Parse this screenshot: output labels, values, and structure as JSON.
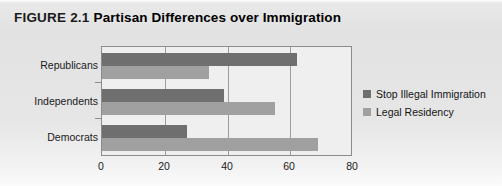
{
  "figure": {
    "label": "FIGURE 2.1",
    "title": "Partisan Differences over Immigration"
  },
  "legend": {
    "position": "right",
    "entries": [
      {
        "label": "Stop Illegal Immigration",
        "color": "#6f6f6f"
      },
      {
        "label": "Legal Residency",
        "color": "#a0a0a0"
      }
    ]
  },
  "axis": {
    "x_ticks": [
      "0",
      "20",
      "40",
      "60",
      "80"
    ]
  },
  "chart_data": {
    "type": "bar",
    "orientation": "horizontal",
    "title": "Partisan Differences over Immigration",
    "xlabel": "",
    "ylabel": "",
    "categories": [
      "Republicans",
      "Independents",
      "Democrats"
    ],
    "series": [
      {
        "name": "Stop Illegal Immigration",
        "color": "#6f6f6f",
        "values": [
          62,
          39,
          27
        ]
      },
      {
        "name": "Legal Residency",
        "color": "#a0a0a0",
        "values": [
          34,
          55,
          69
        ]
      }
    ],
    "xlim": [
      0,
      80
    ],
    "xticks": [
      0,
      20,
      40,
      60,
      80
    ],
    "grid": "vertical",
    "legend_position": "right"
  }
}
